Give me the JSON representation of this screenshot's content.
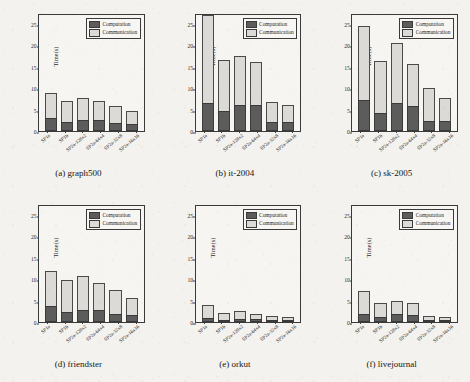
{
  "figure": {
    "axis": {
      "ylabel": "Time(s)",
      "yticks": [
        0,
        5,
        10,
        15,
        20,
        25
      ],
      "ylim": [
        0,
        27.5
      ],
      "categories": [
        "SP1a",
        "SP1b",
        "SP2a-128x2",
        "SP2a-64x4",
        "SP2a-32x8",
        "SP2a-16x16"
      ]
    },
    "legend": {
      "computation_label": "Computation",
      "communication_label": "Communication",
      "computation_color": "#5c5c5c",
      "communication_color": "#dbdad6",
      "position": "top-right"
    }
  },
  "chart_data": [
    {
      "type": "bar",
      "panel": "a",
      "title": "(a) graph500",
      "xlabel": "",
      "ylabel": "Time(s)",
      "ylim": [
        0,
        27.5
      ],
      "yticks": [
        0,
        5,
        10,
        15,
        20,
        25
      ],
      "grid": false,
      "stacked": true,
      "categories": [
        "SP1a",
        "SP1b",
        "SP2a-128x2",
        "SP2a-64x4",
        "SP2a-32x8",
        "SP2a-16x16"
      ],
      "series": [
        {
          "name": "Computation",
          "values": [
            3.1,
            2.1,
            2.6,
            2.6,
            1.8,
            1.7
          ]
        },
        {
          "name": "Communication",
          "values": [
            5.7,
            5.0,
            5.2,
            4.4,
            4.1,
            3.0
          ]
        }
      ],
      "totals": [
        8.8,
        7.1,
        7.8,
        7.0,
        5.9,
        4.7
      ]
    },
    {
      "type": "bar",
      "panel": "b",
      "title": "(b) it-2004",
      "xlabel": "",
      "ylabel": "Time(s)",
      "ylim": [
        0,
        27.5
      ],
      "yticks": [
        0,
        5,
        10,
        15,
        20,
        25
      ],
      "grid": false,
      "stacked": true,
      "categories": [
        "SP1a",
        "SP1b",
        "SP2a-128x2",
        "SP2a-64x4",
        "SP2a-32x8",
        "SP2a-16x16"
      ],
      "series": [
        {
          "name": "Computation",
          "values": [
            6.6,
            4.6,
            6.0,
            6.0,
            2.0,
            2.0
          ]
        },
        {
          "name": "Communication",
          "values": [
            20.7,
            11.9,
            11.5,
            10.0,
            4.7,
            4.1
          ]
        }
      ],
      "totals": [
        27.3,
        16.5,
        17.5,
        16.0,
        6.7,
        6.1
      ]
    },
    {
      "type": "bar",
      "panel": "c",
      "title": "(c) sk-2005",
      "xlabel": "",
      "ylabel": "Time(s)",
      "ylim": [
        0,
        27.5
      ],
      "yticks": [
        0,
        5,
        10,
        15,
        20,
        25
      ],
      "grid": false,
      "stacked": true,
      "categories": [
        "SP1a",
        "SP1b",
        "SP2a-128x2",
        "SP2a-64x4",
        "SP2a-32x8",
        "SP2a-16x16"
      ],
      "series": [
        {
          "name": "Computation",
          "values": [
            7.2,
            4.2,
            6.6,
            5.8,
            2.4,
            2.4
          ]
        },
        {
          "name": "Communication",
          "values": [
            17.3,
            12.2,
            13.9,
            9.8,
            7.6,
            5.2
          ]
        }
      ],
      "totals": [
        24.5,
        16.4,
        20.5,
        15.6,
        10.0,
        7.6
      ]
    },
    {
      "type": "bar",
      "panel": "d",
      "title": "(d) friendster",
      "xlabel": "",
      "ylabel": "Time(s)",
      "ylim": [
        0,
        27.5
      ],
      "yticks": [
        0,
        5,
        10,
        15,
        20,
        25
      ],
      "grid": false,
      "stacked": true,
      "categories": [
        "SP1a",
        "SP1b",
        "SP2a-128x2",
        "SP2a-64x4",
        "SP2a-32x8",
        "SP2a-16x16"
      ],
      "series": [
        {
          "name": "Computation",
          "values": [
            3.7,
            2.3,
            2.9,
            2.9,
            1.8,
            1.6
          ]
        },
        {
          "name": "Communication",
          "values": [
            8.2,
            7.5,
            7.8,
            6.3,
            5.6,
            4.1
          ]
        }
      ],
      "totals": [
        11.9,
        9.8,
        10.7,
        9.2,
        7.4,
        5.7
      ]
    },
    {
      "type": "bar",
      "panel": "e",
      "title": "(e) orkut",
      "xlabel": "",
      "ylabel": "Time(s)",
      "ylim": [
        0,
        27.5
      ],
      "yticks": [
        0,
        5,
        10,
        15,
        20,
        25
      ],
      "grid": false,
      "stacked": true,
      "categories": [
        "SP1a",
        "SP1b",
        "SP2a-128x2",
        "SP2a-64x4",
        "SP2a-32x8",
        "SP2a-16x16"
      ],
      "series": [
        {
          "name": "Computation",
          "values": [
            0.9,
            0.4,
            0.6,
            0.6,
            0.3,
            0.2
          ]
        },
        {
          "name": "Communication",
          "values": [
            3.1,
            1.7,
            1.9,
            1.3,
            0.9,
            0.7
          ]
        }
      ],
      "totals": [
        4.0,
        2.1,
        2.5,
        1.9,
        1.2,
        0.9
      ]
    },
    {
      "type": "bar",
      "panel": "f",
      "title": "(f) livejournal",
      "xlabel": "",
      "ylabel": "Time(s)",
      "ylim": [
        0,
        27.5
      ],
      "yticks": [
        0,
        5,
        10,
        15,
        20,
        25
      ],
      "grid": false,
      "stacked": true,
      "categories": [
        "SP1a",
        "SP1b",
        "SP2a-128x2",
        "SP2a-64x4",
        "SP2a-32x8",
        "SP2a-16x16"
      ],
      "series": [
        {
          "name": "Computation",
          "values": [
            1.8,
            1.1,
            1.8,
            1.6,
            0.5,
            0.4
          ]
        },
        {
          "name": "Communication",
          "values": [
            5.5,
            3.4,
            3.1,
            2.8,
            0.9,
            0.8
          ]
        }
      ],
      "totals": [
        7.3,
        4.5,
        4.9,
        4.4,
        1.4,
        1.2
      ]
    }
  ]
}
